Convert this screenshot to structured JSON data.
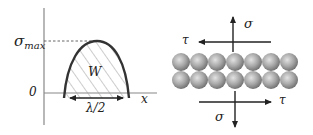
{
  "left_panel": {
    "y_axis_label_sigma": "σ",
    "y_axis_label_sub": "max",
    "origin_label": "0",
    "x_axis_label": "x",
    "area_label": "W",
    "width_label": "λ/2"
  },
  "right_panel": {
    "top_normal_label": "σ",
    "top_shear_label": "τ",
    "bottom_normal_label": "σ",
    "bottom_shear_label": "τ",
    "atom_rows": 2,
    "atoms_per_row": 7
  },
  "colors": {
    "line": "#222222",
    "axis": "#888888",
    "atom_light": "#d8d8d8",
    "atom_dark": "#7a7a7a"
  }
}
